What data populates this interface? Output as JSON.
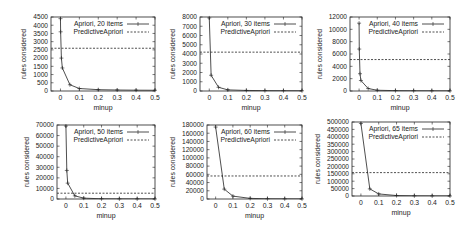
{
  "chart_data": [
    {
      "type": "line",
      "title": "",
      "xlabel": "minup",
      "ylabel": "rules considered",
      "xlim": [
        -0.05,
        0.5
      ],
      "ylim": [
        0,
        4500
      ],
      "xticks": [
        "0",
        "0.1",
        "0.2",
        "0.3",
        "0.4",
        "0.5"
      ],
      "yticks": [
        "0",
        "500",
        "1000",
        "1500",
        "2000",
        "2500",
        "3000",
        "3500",
        "4000",
        "4500"
      ],
      "legend_position": "upper right",
      "grid": false,
      "series": [
        {
          "name": "Apriori, 20 items",
          "style": "solid-with-points",
          "x": [
            0,
            0.001,
            0.005,
            0.01,
            0.05,
            0.1,
            0.2,
            0.3,
            0.4,
            0.5
          ],
          "values": [
            4400,
            3600,
            2000,
            1400,
            380,
            150,
            80,
            60,
            50,
            45
          ]
        },
        {
          "name": "PredictiveApriori",
          "style": "dashed",
          "x": [
            -0.05,
            0.5
          ],
          "values": [
            2600,
            2600
          ]
        }
      ]
    },
    {
      "type": "line",
      "title": "",
      "xlabel": "minup",
      "ylabel": "rules considered",
      "xlim": [
        -0.05,
        0.5
      ],
      "ylim": [
        0,
        8000
      ],
      "xticks": [
        "0",
        "0.1",
        "0.2",
        "0.3",
        "0.4",
        "0.5"
      ],
      "yticks": [
        "0",
        "1000",
        "2000",
        "3000",
        "4000",
        "5000",
        "6000",
        "7000",
        "8000"
      ],
      "legend_position": "upper right",
      "grid": false,
      "series": [
        {
          "name": "Apriori, 30 items",
          "style": "solid-with-points",
          "x": [
            0,
            0.01,
            0.05,
            0.1,
            0.2,
            0.3,
            0.4,
            0.5
          ],
          "values": [
            7900,
            1700,
            400,
            120,
            60,
            40,
            30,
            25
          ]
        },
        {
          "name": "PredictiveApriori",
          "style": "dashed",
          "x": [
            -0.05,
            0.5
          ],
          "values": [
            4200,
            4200
          ]
        }
      ]
    },
    {
      "type": "line",
      "title": "",
      "xlabel": "minup",
      "ylabel": "rules considered",
      "xlim": [
        -0.05,
        0.5
      ],
      "ylim": [
        0,
        12000
      ],
      "xticks": [
        "0",
        "0.1",
        "0.2",
        "0.3",
        "0.4",
        "0.5"
      ],
      "yticks": [
        "0",
        "2000",
        "4000",
        "6000",
        "8000",
        "10000",
        "12000"
      ],
      "legend_position": "upper right",
      "grid": false,
      "series": [
        {
          "name": "Apriori, 40 items",
          "style": "solid-with-points",
          "x": [
            0,
            0.001,
            0.005,
            0.01,
            0.05,
            0.1,
            0.2,
            0.3,
            0.4,
            0.5
          ],
          "values": [
            11000,
            6800,
            2800,
            1700,
            400,
            120,
            60,
            40,
            30,
            25
          ]
        },
        {
          "name": "PredictiveApriori",
          "style": "dashed",
          "x": [
            -0.05,
            0.5
          ],
          "values": [
            5100,
            5100
          ]
        }
      ]
    },
    {
      "type": "line",
      "title": "",
      "xlabel": "minup",
      "ylabel": "rules considered",
      "xlim": [
        -0.05,
        0.5
      ],
      "ylim": [
        0,
        70000
      ],
      "xticks": [
        "0",
        "0.1",
        "0.2",
        "0.3",
        "0.4",
        "0.5"
      ],
      "yticks": [
        "0",
        "10000",
        "20000",
        "30000",
        "40000",
        "50000",
        "60000",
        "70000"
      ],
      "legend_position": "upper right",
      "grid": false,
      "series": [
        {
          "name": "Apriori, 50 items",
          "style": "solid-with-points",
          "x": [
            0,
            0.005,
            0.01,
            0.05,
            0.1,
            0.2,
            0.3,
            0.4,
            0.5
          ],
          "values": [
            69000,
            27000,
            15000,
            3000,
            800,
            200,
            100,
            80,
            60
          ]
        },
        {
          "name": "PredictiveApriori",
          "style": "dashed",
          "x": [
            -0.05,
            0.5
          ],
          "values": [
            5500,
            5500
          ]
        }
      ]
    },
    {
      "type": "line",
      "title": "",
      "xlabel": "minup",
      "ylabel": "rules considered",
      "xlim": [
        -0.05,
        0.5
      ],
      "ylim": [
        0,
        180000
      ],
      "xticks": [
        "0",
        "0.1",
        "0.2",
        "0.3",
        "0.4",
        "0.5"
      ],
      "yticks": [
        "0",
        "20000",
        "40000",
        "60000",
        "80000",
        "100000",
        "120000",
        "140000",
        "160000",
        "180000"
      ],
      "legend_position": "upper right",
      "grid": false,
      "series": [
        {
          "name": "Apriori, 60 items",
          "style": "solid-with-points",
          "x": [
            0,
            0.05,
            0.1,
            0.2,
            0.3,
            0.4,
            0.5
          ],
          "values": [
            175000,
            24000,
            7000,
            1500,
            500,
            300,
            200
          ]
        },
        {
          "name": "PredictiveApriori",
          "style": "dashed",
          "x": [
            -0.05,
            0.5
          ],
          "values": [
            56000,
            56000
          ]
        }
      ]
    },
    {
      "type": "line",
      "title": "",
      "xlabel": "minup",
      "ylabel": "rules considered",
      "xlim": [
        -0.05,
        0.5
      ],
      "ylim": [
        0,
        500000
      ],
      "xticks": [
        "0",
        "0.1",
        "0.2",
        "0.3",
        "0.4",
        "0.5"
      ],
      "yticks": [
        "0",
        "50000",
        "100000",
        "150000",
        "200000",
        "250000",
        "300000",
        "350000",
        "400000",
        "450000",
        "500000"
      ],
      "legend_position": "upper right",
      "grid": false,
      "series": [
        {
          "name": "Apriori, 65 items",
          "style": "solid-with-points",
          "x": [
            0,
            0.05,
            0.1,
            0.2,
            0.3,
            0.4,
            0.5
          ],
          "values": [
            490000,
            48000,
            14000,
            3000,
            1000,
            500,
            300
          ]
        },
        {
          "name": "PredictiveApriori",
          "style": "dashed",
          "x": [
            -0.05,
            0.5
          ],
          "values": [
            158000,
            158000
          ]
        }
      ]
    }
  ]
}
